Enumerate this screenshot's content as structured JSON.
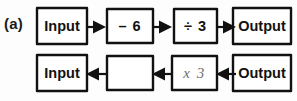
{
  "figure": {
    "part_label": "(a)",
    "ink_color": "#111111",
    "faint_ink_color": "#6d6d6d",
    "background_color": "#fdfdfd"
  },
  "rows": [
    {
      "id": "top-row",
      "direction": "left-to-right",
      "boxes": [
        {
          "id": "input",
          "label": "Input",
          "style": "bold",
          "x": 35,
          "y": 0,
          "w": 54,
          "h": 40
        },
        {
          "id": "minus-six",
          "label": "– 6",
          "style": "op",
          "x": 105,
          "y": 1,
          "w": 50,
          "h": 38
        },
        {
          "id": "divide-three",
          "label": "÷ 3",
          "style": "op",
          "x": 172,
          "y": 1,
          "w": 47,
          "h": 38
        },
        {
          "id": "output",
          "label": "Output",
          "style": "bold",
          "x": 231,
          "y": 0,
          "w": 62,
          "h": 40
        }
      ],
      "arrows": [
        {
          "id": "arrow-1",
          "direction": "right",
          "x": 86,
          "y": 14
        },
        {
          "id": "arrow-2",
          "direction": "right",
          "x": 152,
          "y": 14
        },
        {
          "id": "arrow-3",
          "direction": "right",
          "x": 216,
          "y": 14
        }
      ]
    },
    {
      "id": "bottom-row",
      "direction": "right-to-left",
      "boxes": [
        {
          "id": "input",
          "label": "Input",
          "style": "bold",
          "x": 35,
          "y": 0,
          "w": 54,
          "h": 40
        },
        {
          "id": "blank-answer",
          "label": "",
          "style": "blank",
          "x": 105,
          "y": 1,
          "w": 50,
          "h": 38
        },
        {
          "id": "times-three",
          "label": "x 3",
          "style": "faint",
          "x": 170,
          "y": 1,
          "w": 49,
          "h": 38
        },
        {
          "id": "output",
          "label": "Output",
          "style": "bold",
          "x": 231,
          "y": 0,
          "w": 62,
          "h": 40
        }
      ],
      "arrows": [
        {
          "id": "arrow-1",
          "direction": "left",
          "x": 86,
          "y": 14
        },
        {
          "id": "arrow-2",
          "direction": "left",
          "x": 152,
          "y": 14
        },
        {
          "id": "arrow-3",
          "direction": "left",
          "x": 216,
          "y": 14
        }
      ]
    }
  ]
}
